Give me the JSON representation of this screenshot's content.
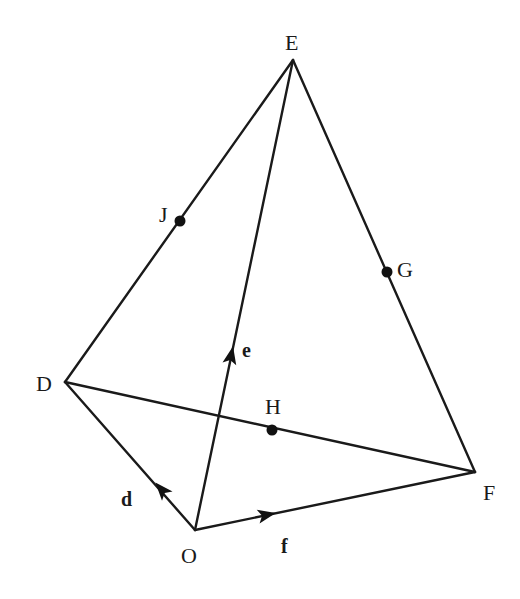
{
  "figure": {
    "type": "tetrahedron-vector-diagram",
    "vertices": {
      "E": {
        "label": "E",
        "x": 293,
        "y": 60
      },
      "D": {
        "label": "D",
        "x": 65,
        "y": 382
      },
      "F": {
        "label": "F",
        "x": 475,
        "y": 472
      },
      "O": {
        "label": "O",
        "x": 195,
        "y": 530
      }
    },
    "points": {
      "J": {
        "label": "J",
        "on": "DE",
        "x": 180,
        "y": 221
      },
      "G": {
        "label": "G",
        "on": "EF",
        "x": 387,
        "y": 272
      },
      "H": {
        "label": "H",
        "on": "DF",
        "x": 272,
        "y": 430
      }
    },
    "edges": [
      "OD",
      "OE",
      "OF",
      "DE",
      "EF",
      "DF"
    ],
    "vectors": {
      "d": {
        "label": "d",
        "from": "O",
        "to": "D"
      },
      "e": {
        "label": "e",
        "from": "O",
        "to": "E"
      },
      "f": {
        "label": "f",
        "from": "O",
        "to": "F"
      }
    },
    "colors": {
      "line": "#1a1a1a",
      "background": "#ffffff"
    }
  }
}
